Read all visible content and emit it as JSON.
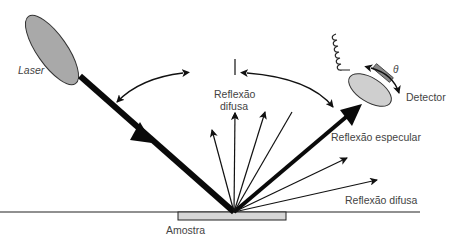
{
  "diagram": {
    "type": "specular-diffuse-reflection-setup",
    "labels": {
      "laser": "Laser",
      "detector": "Detector",
      "theta": "θ",
      "diffuse_top_line1": "Reflexão",
      "diffuse_top_line2": "difusa",
      "specular": "Reflexão especular",
      "diffuse_right": "Reflexão difusa",
      "sample": "Amostra"
    },
    "components": [
      {
        "name": "laser-source",
        "shape": "ellipse",
        "color": "#a9a9a9"
      },
      {
        "name": "incident-beam",
        "shape": "thick-line"
      },
      {
        "name": "specular-beam",
        "shape": "thick-line"
      },
      {
        "name": "detector",
        "shape": "ellipse",
        "color": "#cfcfcf"
      },
      {
        "name": "sample",
        "shape": "rectangle",
        "color": "#d6d6d6"
      },
      {
        "name": "normal-line",
        "shape": "line"
      },
      {
        "name": "diffuse-rays",
        "count": 7
      },
      {
        "name": "angle-arcs",
        "count": 2
      }
    ],
    "colors": {
      "line": "#111111",
      "laser_fill": "#a9a9a9",
      "detector_fill": "#cfcfcf",
      "sample_fill": "#d6d6d6",
      "text": "#444444"
    }
  }
}
